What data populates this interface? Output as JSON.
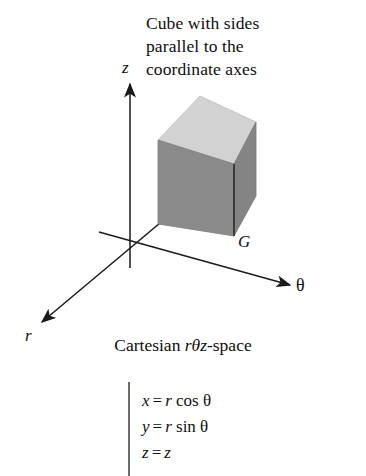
{
  "figure": {
    "title_lines": [
      "Cube with sides",
      "parallel to the",
      "coordinate axes"
    ],
    "caption_prefix": "Cartesian ",
    "caption_symbols": "rθz",
    "caption_suffix": "-space",
    "axes": [
      {
        "name": "z-axis",
        "label": "z"
      },
      {
        "name": "theta-axis",
        "label": "θ"
      },
      {
        "name": "r-axis",
        "label": "r"
      }
    ],
    "solid_label": "G",
    "colors": {
      "top_face": "#d2d2d2",
      "front_face": "#8b8b8b",
      "side_face": "#848484",
      "outline": "#2b2b2b",
      "axis": "#1a1a1a",
      "text": "#111111",
      "background": "#ffffff"
    },
    "equations": [
      {
        "lhs": "x",
        "op": "=",
        "rhs_var": "r",
        "rhs_fn": "cos",
        "rhs_arg": "θ"
      },
      {
        "lhs": "y",
        "op": "=",
        "rhs_var": "r",
        "rhs_fn": "sin",
        "rhs_arg": "θ"
      },
      {
        "lhs": "z",
        "op": "=",
        "rhs_var": "z",
        "rhs_fn": "",
        "rhs_arg": ""
      }
    ]
  }
}
